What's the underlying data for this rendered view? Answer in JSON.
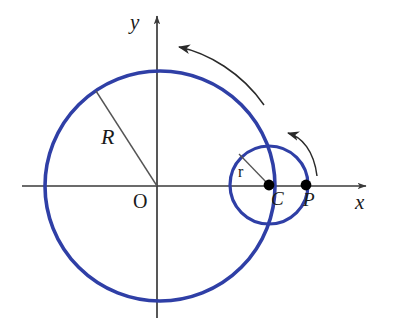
{
  "figure": {
    "domain": "geometry-diagram",
    "width": 394,
    "height": 332,
    "background_color": "#ffffff"
  },
  "colors": {
    "curve_blue": "#2f3fa6",
    "axis_black": "#3a3a3a",
    "label_black": "#1a1a1a",
    "radius_line": "#555555",
    "point_fill": "#000000",
    "arrow_stroke": "#2a2a2a"
  },
  "axes": {
    "x_axis": {
      "label": "x",
      "label_x": 355,
      "label_y": 190,
      "start_x": 22,
      "end_x": 370,
      "y": 186,
      "arrow": "right"
    },
    "y_axis": {
      "label": "y",
      "label_x": 130,
      "label_y": 10,
      "x": 157,
      "start_y": 318,
      "end_y": 12,
      "arrow": "up"
    },
    "origin": {
      "label": "O",
      "x": 157,
      "y": 186,
      "label_x": 133,
      "label_y": 190
    }
  },
  "circles": {
    "large": {
      "name": "fixed-circle",
      "center_x": 160,
      "center_y": 186,
      "radius": 115,
      "stroke_width": 3.6,
      "color": "#2f3fa6"
    },
    "small": {
      "name": "rolling-circle",
      "center_x": 269,
      "center_y": 185,
      "radius": 39,
      "stroke_width": 3.2,
      "color": "#2f3fa6"
    }
  },
  "points": [
    {
      "id": "C",
      "label": "C",
      "x": 269,
      "y": 185,
      "label_x": 271,
      "label_y": 188,
      "dot_radius": 5.4,
      "description": "center of rolling circle"
    },
    {
      "id": "P",
      "label": "P",
      "x": 306,
      "y": 185,
      "label_x": 303,
      "label_y": 189,
      "dot_radius": 5.4,
      "description": "tracing point on rolling circle"
    }
  ],
  "radii": [
    {
      "id": "R",
      "label": "R",
      "from_x": 157,
      "from_y": 186,
      "to_x": 96,
      "to_y": 91,
      "label_x": 101,
      "label_y": 124,
      "description": "radius of the large fixed circle"
    },
    {
      "id": "r",
      "label": "r",
      "from_x": 269,
      "from_y": 185,
      "to_x": 239,
      "to_y": 154,
      "label_x": 238,
      "label_y": 163,
      "description": "radius of the small rolling circle"
    }
  ],
  "arrows": [
    {
      "id": "outer-rotation-arrow",
      "name": "counterclockwise-rotation-arrow-large",
      "direction": "counterclockwise",
      "path": "M 262,103 C 240,72 205,52 176,47",
      "head_x": 172,
      "head_y": 46,
      "head_angle": -190
    },
    {
      "id": "inner-rotation-arrow",
      "name": "counterclockwise-rotation-arrow-small",
      "direction": "counterclockwise",
      "path": "M 316,174 C 312,150 300,136 285,133",
      "head_x": 280,
      "head_y": 132,
      "head_angle": -190
    }
  ]
}
